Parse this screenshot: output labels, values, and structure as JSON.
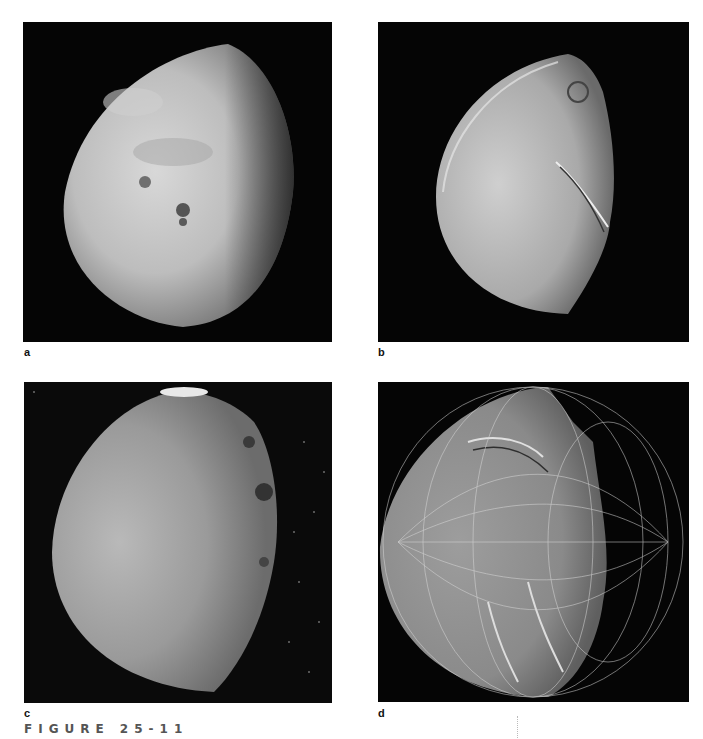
{
  "figure": {
    "caption": "FIGURE 25-11"
  },
  "panels": [
    {
      "id": "a",
      "label": "a",
      "subject": "moon-photo-oberon-like",
      "background": "#050505"
    },
    {
      "id": "b",
      "label": "b",
      "subject": "moon-photo-titania-like",
      "background": "#050505"
    },
    {
      "id": "c",
      "label": "c",
      "subject": "moon-photo-umbriel-like",
      "background": "#0a0a0a"
    },
    {
      "id": "d",
      "label": "d",
      "subject": "moon-photo-miranda-with-grid",
      "background": "#050505"
    }
  ]
}
